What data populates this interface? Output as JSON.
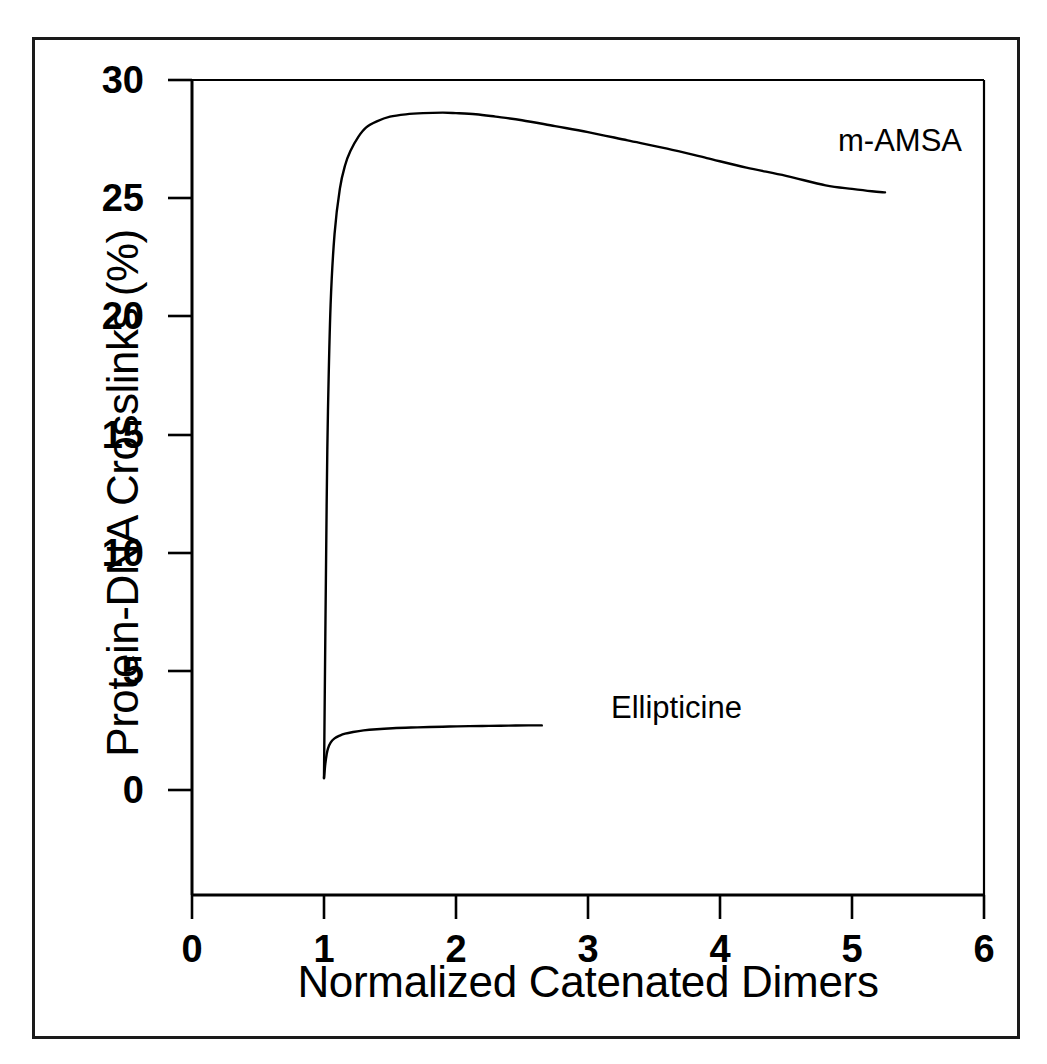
{
  "chart_data": {
    "type": "line",
    "title": "",
    "subtitle": "",
    "xlabel": "Normalized Catenated Dimers",
    "ylabel": "Protein-DNA Crosslinks (%)",
    "xlim": [
      0,
      6
    ],
    "ylim": [
      0,
      30
    ],
    "y_axis_extends_below_zero": true,
    "grid": false,
    "legend_position": "inline-annotation",
    "xticks": [
      0,
      1,
      2,
      3,
      4,
      5,
      6
    ],
    "xtick_labels": [
      "0",
      "1",
      "2",
      "3",
      "4",
      "5",
      "6"
    ],
    "yticks": [
      0,
      5,
      10,
      15,
      20,
      25,
      30
    ],
    "ytick_labels": [
      "0",
      "5",
      "10",
      "15",
      "20",
      "25",
      "30"
    ],
    "line_color": "#000000",
    "series": [
      {
        "name": "m-AMSA",
        "annotation": "m-AMSA",
        "x": [
          1.0,
          1.01,
          1.02,
          1.03,
          1.05,
          1.08,
          1.12,
          1.16,
          1.2,
          1.26,
          1.32,
          1.4,
          1.5,
          1.62,
          1.75,
          1.9,
          2.0,
          2.15,
          2.3,
          2.5,
          2.75,
          3.0,
          3.3,
          3.6,
          3.9,
          4.2,
          4.5,
          4.8,
          5.0,
          5.15,
          5.25
        ],
        "values": [
          0.5,
          6.5,
          12.0,
          16.0,
          20.5,
          23.5,
          25.4,
          26.4,
          27.0,
          27.6,
          28.0,
          28.25,
          28.45,
          28.55,
          28.6,
          28.62,
          28.6,
          28.55,
          28.45,
          28.3,
          28.05,
          27.8,
          27.45,
          27.1,
          26.7,
          26.3,
          25.95,
          25.55,
          25.4,
          25.3,
          25.25
        ]
      },
      {
        "name": "Ellipticine",
        "annotation": "Ellipticine",
        "x": [
          1.0,
          1.01,
          1.02,
          1.03,
          1.05,
          1.08,
          1.12,
          1.16,
          1.22,
          1.3,
          1.4,
          1.52,
          1.66,
          1.8,
          1.95,
          2.1,
          2.25,
          2.4,
          2.55,
          2.65
        ],
        "values": [
          0.5,
          1.1,
          1.5,
          1.75,
          2.0,
          2.18,
          2.3,
          2.38,
          2.45,
          2.52,
          2.57,
          2.61,
          2.64,
          2.66,
          2.68,
          2.7,
          2.71,
          2.72,
          2.73,
          2.73
        ]
      }
    ]
  },
  "figure": {
    "x_axis_title": "Normalized Catenated Dimers",
    "y_axis_title": "Protein-DNA Crosslinks (%)",
    "annotations": {
      "mamsa": "m-AMSA",
      "ellipticine": "Ellipticine"
    },
    "ytick_labels": [
      "30",
      "25",
      "20",
      "15",
      "10",
      "5",
      "0"
    ],
    "xtick_labels": [
      "0",
      "1",
      "2",
      "3",
      "4",
      "5",
      "6"
    ]
  }
}
